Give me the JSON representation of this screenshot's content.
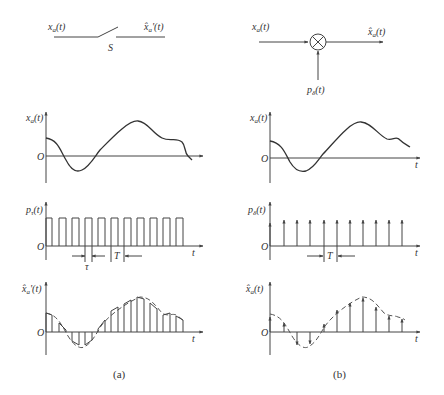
{
  "figure": {
    "panel_a": {
      "caption": "(a)",
      "block": {
        "input_label": "x_a(t)",
        "output_label": "x̂'_a(t)",
        "switch_label": "S",
        "type": "switch sampler"
      },
      "plot1": {
        "ylabel": "x_a(t)",
        "origin": "O",
        "xlabel": "t"
      },
      "plot2": {
        "ylabel": "p_τ(t)",
        "origin": "O",
        "xlabel": "t",
        "tau_label": "τ",
        "period_label": "T"
      },
      "plot3": {
        "ylabel": "x̂'_a(t)",
        "origin": "O",
        "xlabel": "t"
      }
    },
    "panel_b": {
      "caption": "(b)",
      "block": {
        "input_label": "x_a(t)",
        "output_label": "x̂_a(t)",
        "multiplier_input_label": "p_δ(t)",
        "type": "multiplier"
      },
      "plot1": {
        "ylabel": "x_a(t)",
        "origin": "O",
        "xlabel": "t"
      },
      "plot2": {
        "ylabel": "p_δ(t)",
        "origin": "O",
        "xlabel": "t",
        "period_label": "T"
      },
      "plot3": {
        "ylabel": "x̂_a(t)",
        "origin": "O",
        "xlabel": "t"
      }
    }
  },
  "labels": {
    "a_in": "x",
    "a_in_sub": "a",
    "a_in_arg": "(t)",
    "a_out": "x̂",
    "a_out_sub": "a",
    "a_out_arg": "'(t)",
    "a_switch": "S",
    "b_in": "x",
    "b_in_sub": "a",
    "b_in_arg": "(t)",
    "b_out": "x̂",
    "b_out_sub": "a",
    "b_out_arg": "(t)",
    "b_p": "p",
    "b_p_sub": "δ",
    "b_p_arg": "(t)",
    "xa": "x",
    "xa_sub": "a",
    "xa_arg": "(t)",
    "ptau": "p",
    "ptau_sub": "τ",
    "ptau_arg": "(t)",
    "pdelta": "p",
    "pdelta_sub": "δ",
    "pdelta_arg": "(t)",
    "xhat_a": "x̂",
    "xhat_a_sub": "a",
    "xhat_a_arg": "'(t)",
    "xhat_b": "x̂",
    "xhat_b_sub": "a",
    "xhat_b_arg": "(t)",
    "origin": "O",
    "t": "t",
    "tau": "τ",
    "T": "T",
    "cap_a": "(a)",
    "cap_b": "(b)"
  }
}
